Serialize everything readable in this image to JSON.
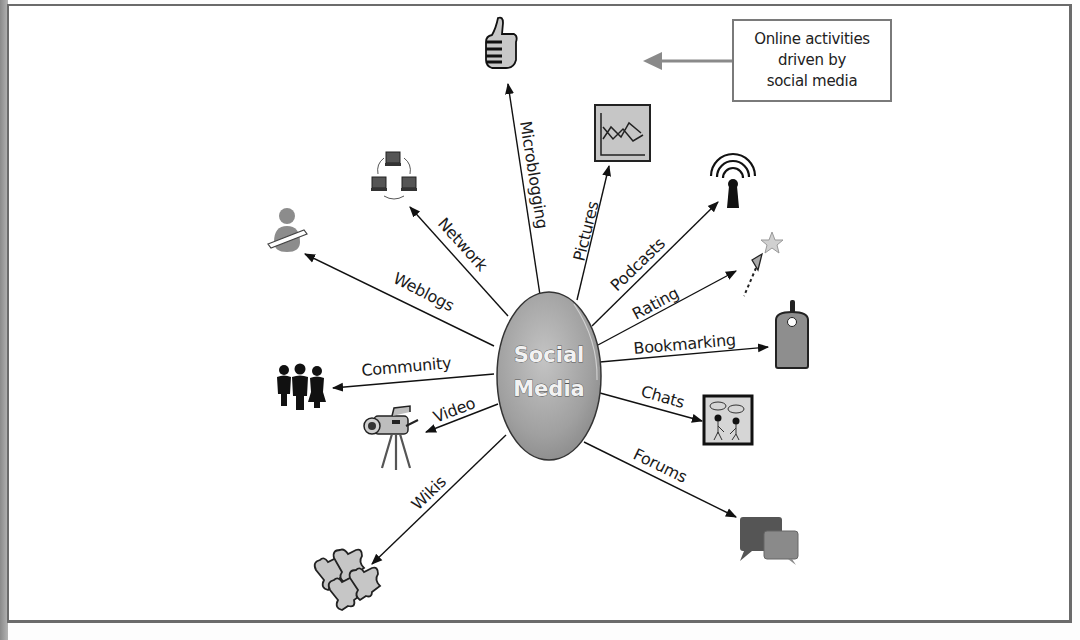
{
  "diagram": {
    "type": "hub-and-spoke",
    "center": {
      "line1": "Social",
      "line2": "Media"
    },
    "callout": {
      "lines": [
        "Online activities",
        "driven by",
        "social media"
      ]
    },
    "spokes": [
      {
        "id": "microblogging",
        "label": "Microblogging",
        "icon": "thumbs-up-icon"
      },
      {
        "id": "pictures",
        "label": "Pictures",
        "icon": "picture-chart-icon"
      },
      {
        "id": "podcasts",
        "label": "Podcasts",
        "icon": "broadcast-icon"
      },
      {
        "id": "rating",
        "label": "Rating",
        "icon": "star-cursor-icon"
      },
      {
        "id": "bookmarking",
        "label": "Bookmarking",
        "icon": "tag-icon"
      },
      {
        "id": "chats",
        "label": "Chats",
        "icon": "chat-people-icon"
      },
      {
        "id": "forums",
        "label": "Forums",
        "icon": "speech-bubbles-icon"
      },
      {
        "id": "wikis",
        "label": "Wikis",
        "icon": "puzzle-pieces-icon"
      },
      {
        "id": "video",
        "label": "Video",
        "icon": "video-camera-icon"
      },
      {
        "id": "community",
        "label": "Community",
        "icon": "people-group-icon"
      },
      {
        "id": "weblogs",
        "label": "Weblogs",
        "icon": "person-pencil-icon"
      },
      {
        "id": "network",
        "label": "Network",
        "icon": "network-computers-icon"
      }
    ]
  },
  "colors": {
    "frame": "#6b6b6b",
    "hub_fill": "#a3a3a3",
    "icon_gray": "#8c8c8c",
    "callout_arrow": "#8a8a8a",
    "text": "#1a1a1a"
  }
}
